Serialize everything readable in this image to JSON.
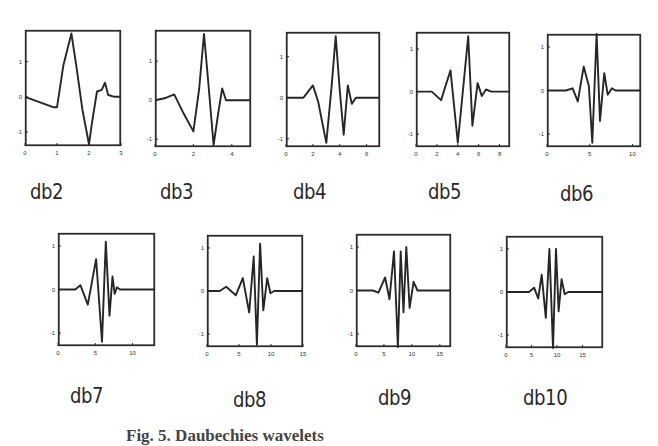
{
  "figure": {
    "caption": "Fig. 5. Daubechies wavelets"
  },
  "chart_data": [
    {
      "type": "line",
      "title": "db2",
      "xlabel": "",
      "ylabel": "",
      "xlim": [
        0,
        3
      ],
      "ylim": [
        -1.4,
        1.9
      ],
      "xticks": [
        0,
        1,
        2,
        3
      ],
      "yticks": [
        -1,
        0,
        1
      ],
      "x": [
        0,
        0.3,
        0.6,
        0.9,
        1.0,
        1.2,
        1.45,
        1.6,
        1.8,
        2.0,
        2.1,
        2.25,
        2.4,
        2.5,
        2.6,
        2.8,
        3.0
      ],
      "y": [
        0,
        -0.1,
        -0.2,
        -0.3,
        -0.3,
        0.9,
        1.8,
        0.9,
        -0.4,
        -1.35,
        -0.7,
        0.15,
        0.2,
        0.4,
        0.05,
        0.0,
        0.0
      ]
    },
    {
      "type": "line",
      "title": "db3",
      "xlabel": "",
      "ylabel": "",
      "xlim": [
        0,
        5
      ],
      "ylim": [
        -1.2,
        1.8
      ],
      "xticks": [
        0,
        2,
        4
      ],
      "yticks": [
        -1,
        0,
        1
      ],
      "x": [
        0,
        0.5,
        1.0,
        1.5,
        2.0,
        2.3,
        2.55,
        2.8,
        3.05,
        3.3,
        3.5,
        3.7,
        4.0,
        5.0
      ],
      "y": [
        0,
        0.05,
        0.15,
        -0.35,
        -0.8,
        0.3,
        1.7,
        0.3,
        -1.15,
        -0.3,
        0.3,
        0.0,
        0.0,
        0.0
      ]
    },
    {
      "type": "line",
      "title": "db4",
      "xlabel": "",
      "ylabel": "",
      "xlim": [
        0,
        7
      ],
      "ylim": [
        -1.2,
        1.6
      ],
      "xticks": [
        0,
        2,
        4,
        6
      ],
      "yticks": [
        -1,
        0,
        1
      ],
      "x": [
        0,
        1.3,
        2.0,
        2.4,
        3.0,
        3.4,
        3.7,
        4.0,
        4.3,
        4.6,
        4.9,
        5.2,
        6.0,
        7.0
      ],
      "y": [
        0,
        0,
        0.3,
        -0.1,
        -1.1,
        0.3,
        1.5,
        0.2,
        -0.9,
        0.3,
        -0.15,
        0.0,
        0.0,
        0.0
      ]
    },
    {
      "type": "line",
      "title": "db5",
      "xlabel": "",
      "ylabel": "",
      "xlim": [
        0,
        9
      ],
      "ylim": [
        -1.3,
        1.4
      ],
      "xticks": [
        0,
        2,
        4,
        6,
        8
      ],
      "yticks": [
        -1,
        0,
        1
      ],
      "x": [
        0,
        1.5,
        2.4,
        3.3,
        4.0,
        4.4,
        5.0,
        5.4,
        5.9,
        6.3,
        6.7,
        7.2,
        9.0
      ],
      "y": [
        0,
        0,
        -0.2,
        0.5,
        -1.2,
        -0.2,
        1.3,
        -0.8,
        0.2,
        -0.1,
        0.05,
        0.0,
        0.0
      ]
    },
    {
      "type": "line",
      "title": "db6",
      "xlabel": "",
      "ylabel": "",
      "xlim": [
        0,
        11
      ],
      "ylim": [
        -1.3,
        1.3
      ],
      "xticks": [
        0,
        5,
        10
      ],
      "yticks": [
        -1,
        0,
        1
      ],
      "x": [
        0,
        2.2,
        3.0,
        3.6,
        4.3,
        4.9,
        5.3,
        5.8,
        6.2,
        6.7,
        7.1,
        7.6,
        8.0,
        11.0
      ],
      "y": [
        0,
        0,
        0.05,
        -0.25,
        0.55,
        0.1,
        -1.2,
        1.3,
        -0.7,
        0.4,
        -0.1,
        0.05,
        0.0,
        0.0
      ]
    },
    {
      "type": "line",
      "title": "db7",
      "xlabel": "",
      "ylabel": "",
      "xlim": [
        0,
        13
      ],
      "ylim": [
        -1.3,
        1.3
      ],
      "xticks": [
        0,
        5,
        10
      ],
      "yticks": [
        -1,
        0,
        1
      ],
      "x": [
        0,
        2.3,
        3.0,
        4.0,
        5.1,
        5.9,
        6.4,
        6.9,
        7.3,
        7.6,
        7.9,
        8.3,
        8.6,
        9.0,
        13.0
      ],
      "y": [
        0,
        0,
        0.1,
        -0.35,
        0.7,
        -1.2,
        1.1,
        -0.6,
        0.3,
        -0.1,
        0.05,
        0.0,
        0.0,
        0.0,
        0.0
      ]
    },
    {
      "type": "line",
      "title": "db8",
      "xlabel": "",
      "ylabel": "",
      "xlim": [
        0,
        15
      ],
      "ylim": [
        -1.3,
        1.3
      ],
      "xticks": [
        0,
        5,
        10,
        15
      ],
      "yticks": [
        -1,
        0,
        1
      ],
      "x": [
        0,
        2.0,
        3.0,
        4.5,
        5.6,
        6.6,
        7.3,
        7.8,
        8.3,
        8.8,
        9.4,
        9.9,
        10.5,
        15.0
      ],
      "y": [
        0,
        0,
        0.1,
        -0.1,
        0.3,
        -0.5,
        0.8,
        -1.25,
        1.1,
        -0.45,
        0.3,
        -0.05,
        0.0,
        0.0
      ]
    },
    {
      "type": "line",
      "title": "db9",
      "xlabel": "",
      "ylabel": "",
      "xlim": [
        0,
        17
      ],
      "ylim": [
        -1.3,
        1.3
      ],
      "xticks": [
        0,
        5,
        10,
        15
      ],
      "yticks": [
        -1,
        0,
        1
      ],
      "x": [
        0,
        3.0,
        4.0,
        5.2,
        6.0,
        6.8,
        7.5,
        8.0,
        8.5,
        9.0,
        9.6,
        10.3,
        11.0,
        17.0
      ],
      "y": [
        0,
        0,
        -0.05,
        0.3,
        -0.2,
        0.9,
        -1.3,
        0.9,
        -0.5,
        1.0,
        -0.4,
        0.2,
        0.0,
        0.0
      ]
    },
    {
      "type": "line",
      "title": "db10",
      "xlabel": "",
      "ylabel": "",
      "xlim": [
        0,
        19
      ],
      "ylim": [
        -1.3,
        1.3
      ],
      "xticks": [
        0,
        5,
        10,
        15
      ],
      "yticks": [
        -1,
        0,
        1
      ],
      "x": [
        0,
        4.5,
        5.5,
        6.3,
        7.0,
        7.8,
        8.5,
        9.2,
        9.8,
        10.3,
        10.9,
        11.5,
        12.2,
        19.0
      ],
      "y": [
        0,
        0,
        0.1,
        -0.15,
        0.4,
        -0.6,
        1.0,
        -1.3,
        1.0,
        -0.45,
        0.3,
        -0.05,
        0.0,
        0.0
      ]
    }
  ],
  "layout": {
    "panels": [
      {
        "label": "db2",
        "box": [
          25,
          30,
          96,
          116
        ],
        "label_pos": [
          30,
          180
        ]
      },
      {
        "label": "db3",
        "box": [
          155,
          30,
          96,
          117
        ],
        "label_pos": [
          160,
          180
        ]
      },
      {
        "label": "db4",
        "box": [
          286,
          32,
          94,
          115
        ],
        "label_pos": [
          293,
          180
        ]
      },
      {
        "label": "db5",
        "box": [
          416,
          32,
          94,
          115
        ],
        "label_pos": [
          428,
          180
        ]
      },
      {
        "label": "db6",
        "box": [
          547,
          34,
          94,
          113
        ],
        "label_pos": [
          560,
          182
        ]
      },
      {
        "label": "db7",
        "box": [
          58,
          233,
          97,
          113
        ],
        "label_pos": [
          70,
          384
        ]
      },
      {
        "label": "db8",
        "box": [
          207,
          235,
          96,
          112
        ],
        "label_pos": [
          233,
          388
        ]
      },
      {
        "label": "db9",
        "box": [
          356,
          234,
          95,
          113
        ],
        "label_pos": [
          378,
          386
        ]
      },
      {
        "label": "db10",
        "box": [
          506,
          236,
          97,
          112
        ],
        "label_pos": [
          523,
          386
        ]
      }
    ]
  },
  "style": {
    "line_color": "#262626",
    "box_color": "#2b2b2b",
    "background": "#ffffff"
  }
}
